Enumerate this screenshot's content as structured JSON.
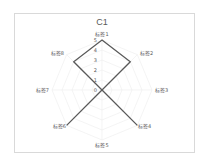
{
  "chart_data": {
    "type": "radar",
    "title": "C1",
    "categories": [
      "标签1",
      "标签2",
      "标签3",
      "标签4",
      "标签5",
      "标签6",
      "标签7",
      "标签8"
    ],
    "series": [
      {
        "name": "C1",
        "values": [
          5,
          4,
          0,
          5,
          0,
          5,
          0,
          4
        ],
        "color": "#595959"
      }
    ],
    "radial_ticks": [
      "0",
      "1",
      "2",
      "3",
      "4",
      "5"
    ],
    "rlim": [
      0,
      5
    ],
    "grid": true,
    "legend": "none"
  },
  "colors": {
    "line": "#595959",
    "grid": "#ececec",
    "border": "#d9d9d9",
    "text": "#595959"
  }
}
